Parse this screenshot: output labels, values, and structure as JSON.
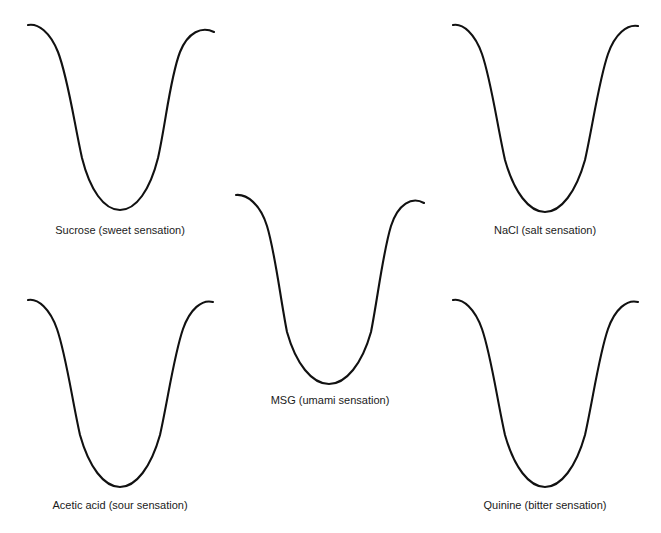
{
  "figure": {
    "background_color": "#ffffff",
    "stroke_color": "#111111",
    "label_color": "#1b1b1b",
    "width": 661,
    "height": 533,
    "scan_header_left": "",
    "scan_header_right": ""
  },
  "panels": [
    {
      "id": "sucrose",
      "label": "Sucrose (sweet sensation)",
      "stimulus": "Sucrose",
      "sensation": "sweet",
      "icon": "tongue-outline-icon"
    },
    {
      "id": "nacl",
      "label": "NaCl (salt sensation)",
      "stimulus": "NaCl",
      "sensation": "salt",
      "icon": "tongue-outline-icon"
    },
    {
      "id": "msg",
      "label": "MSG (umami sensation)",
      "stimulus": "MSG",
      "sensation": "umami",
      "icon": "tongue-outline-icon"
    },
    {
      "id": "acetic-acid",
      "label": "Acetic acid (sour sensation)",
      "stimulus": "Acetic acid",
      "sensation": "sour",
      "icon": "tongue-outline-icon"
    },
    {
      "id": "quinine",
      "label": "Quinine (bitter sensation)",
      "stimulus": "Quinine",
      "sensation": "bitter",
      "icon": "tongue-outline-icon"
    }
  ]
}
